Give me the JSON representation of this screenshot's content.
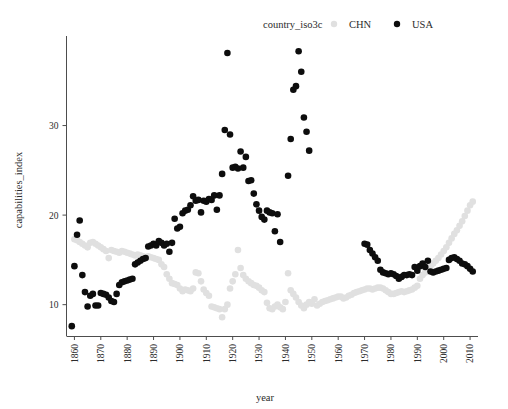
{
  "legend": {
    "title": "country_iso3c",
    "entries": [
      {
        "label": "CHN",
        "color": "#e0e0e0"
      },
      {
        "label": "USA",
        "color": "#0d0d0d"
      }
    ]
  },
  "axes": {
    "x_title": "year",
    "y_title": "capabilities_index",
    "x_ticks": [
      "1860",
      "1870",
      "1880",
      "1890",
      "1900",
      "1910",
      "1920",
      "1930",
      "1940",
      "1950",
      "1960",
      "1970",
      "1980",
      "1990",
      "2000",
      "2010"
    ],
    "y_ticks": [
      "10",
      "20",
      "30"
    ]
  },
  "chart_data": {
    "type": "scatter",
    "title": "",
    "xlabel": "year",
    "ylabel": "capabilities_index",
    "xlim": [
      1857,
      2013
    ],
    "ylim": [
      6.5,
      40
    ],
    "grid": false,
    "legend_position": "top-right",
    "legend_title": "country_iso3c",
    "series": [
      {
        "name": "USA",
        "color": "#0d0d0d",
        "points": [
          [
            1859,
            7.6
          ],
          [
            1860,
            14.3
          ],
          [
            1861,
            17.8
          ],
          [
            1862,
            19.4
          ],
          [
            1863,
            13.3
          ],
          [
            1864,
            11.4
          ],
          [
            1865,
            9.8
          ],
          [
            1866,
            11.0
          ],
          [
            1867,
            11.2
          ],
          [
            1868,
            9.9
          ],
          [
            1869,
            9.9
          ],
          [
            1870,
            11.3
          ],
          [
            1871,
            11.2
          ],
          [
            1872,
            11.1
          ],
          [
            1873,
            10.8
          ],
          [
            1874,
            10.4
          ],
          [
            1875,
            10.3
          ],
          [
            1876,
            11.2
          ],
          [
            1877,
            12.2
          ],
          [
            1878,
            12.5
          ],
          [
            1879,
            12.6
          ],
          [
            1880,
            12.7
          ],
          [
            1881,
            12.8
          ],
          [
            1882,
            12.9
          ],
          [
            1883,
            14.5
          ],
          [
            1884,
            14.7
          ],
          [
            1885,
            14.9
          ],
          [
            1886,
            15.1
          ],
          [
            1887,
            15.2
          ],
          [
            1888,
            16.5
          ],
          [
            1889,
            16.6
          ],
          [
            1890,
            16.8
          ],
          [
            1891,
            16.6
          ],
          [
            1892,
            17.1
          ],
          [
            1893,
            16.9
          ],
          [
            1894,
            16.6
          ],
          [
            1895,
            16.8
          ],
          [
            1896,
            15.9
          ],
          [
            1897,
            16.9
          ],
          [
            1898,
            19.6
          ],
          [
            1899,
            18.5
          ],
          [
            1900,
            18.7
          ],
          [
            1901,
            20.2
          ],
          [
            1902,
            20.5
          ],
          [
            1903,
            20.6
          ],
          [
            1904,
            21.1
          ],
          [
            1905,
            22.1
          ],
          [
            1906,
            21.6
          ],
          [
            1907,
            21.7
          ],
          [
            1908,
            20.3
          ],
          [
            1909,
            21.6
          ],
          [
            1910,
            21.5
          ],
          [
            1911,
            21.8
          ],
          [
            1912,
            21.7
          ],
          [
            1913,
            22.2
          ],
          [
            1914,
            20.6
          ],
          [
            1915,
            22.2
          ],
          [
            1916,
            24.6
          ],
          [
            1917,
            29.5
          ],
          [
            1918,
            38.1
          ],
          [
            1919,
            29.0
          ],
          [
            1920,
            25.3
          ],
          [
            1921,
            25.4
          ],
          [
            1922,
            25.2
          ],
          [
            1923,
            27.1
          ],
          [
            1924,
            25.3
          ],
          [
            1925,
            26.5
          ],
          [
            1926,
            23.8
          ],
          [
            1927,
            23.9
          ],
          [
            1928,
            22.4
          ],
          [
            1929,
            21.2
          ],
          [
            1930,
            20.5
          ],
          [
            1931,
            19.8
          ],
          [
            1932,
            19.5
          ],
          [
            1933,
            20.5
          ],
          [
            1934,
            20.3
          ],
          [
            1935,
            20.2
          ],
          [
            1936,
            18.2
          ],
          [
            1937,
            20.1
          ],
          [
            1938,
            17.0
          ],
          [
            1941,
            24.4
          ],
          [
            1942,
            28.5
          ],
          [
            1943,
            34.0
          ],
          [
            1944,
            34.4
          ],
          [
            1945,
            38.3
          ],
          [
            1946,
            36.0
          ],
          [
            1947,
            30.9
          ],
          [
            1948,
            29.3
          ],
          [
            1949,
            27.2
          ],
          [
            1970,
            16.8
          ],
          [
            1971,
            16.7
          ],
          [
            1972,
            16.1
          ],
          [
            1973,
            15.7
          ],
          [
            1974,
            15.3
          ],
          [
            1975,
            14.9
          ],
          [
            1976,
            13.9
          ],
          [
            1977,
            13.6
          ],
          [
            1978,
            13.5
          ],
          [
            1979,
            13.4
          ],
          [
            1980,
            13.5
          ],
          [
            1981,
            13.4
          ],
          [
            1982,
            13.2
          ],
          [
            1983,
            12.9
          ],
          [
            1984,
            13.1
          ],
          [
            1985,
            13.3
          ],
          [
            1986,
            13.3
          ],
          [
            1987,
            13.4
          ],
          [
            1988,
            13.3
          ],
          [
            1989,
            14.2
          ],
          [
            1990,
            13.8
          ],
          [
            1991,
            14.3
          ],
          [
            1992,
            14.6
          ],
          [
            1993,
            14.2
          ],
          [
            1994,
            14.9
          ],
          [
            1995,
            13.7
          ],
          [
            1996,
            13.6
          ],
          [
            1997,
            13.7
          ],
          [
            1998,
            13.8
          ],
          [
            1999,
            13.9
          ],
          [
            2000,
            14.0
          ],
          [
            2001,
            14.1
          ],
          [
            2002,
            15.0
          ],
          [
            2003,
            15.2
          ],
          [
            2004,
            15.3
          ],
          [
            2005,
            15.1
          ],
          [
            2006,
            14.9
          ],
          [
            2007,
            14.6
          ],
          [
            2008,
            14.5
          ],
          [
            2009,
            14.3
          ],
          [
            2010,
            14.0
          ],
          [
            2011,
            13.7
          ]
        ]
      },
      {
        "name": "CHN",
        "color": "#e0e0e0",
        "points": [
          [
            1860,
            17.3
          ],
          [
            1861,
            17.2
          ],
          [
            1862,
            17.0
          ],
          [
            1863,
            16.8
          ],
          [
            1864,
            16.6
          ],
          [
            1865,
            16.4
          ],
          [
            1866,
            16.9
          ],
          [
            1867,
            17.0
          ],
          [
            1868,
            16.8
          ],
          [
            1869,
            16.6
          ],
          [
            1870,
            16.4
          ],
          [
            1871,
            16.2
          ],
          [
            1872,
            16.0
          ],
          [
            1873,
            15.2
          ],
          [
            1874,
            16.1
          ],
          [
            1875,
            16.0
          ],
          [
            1876,
            15.9
          ],
          [
            1877,
            15.8
          ],
          [
            1878,
            16.0
          ],
          [
            1879,
            15.9
          ],
          [
            1880,
            15.8
          ],
          [
            1881,
            15.7
          ],
          [
            1882,
            15.6
          ],
          [
            1883,
            15.5
          ],
          [
            1884,
            15.6
          ],
          [
            1885,
            15.5
          ],
          [
            1886,
            15.4
          ],
          [
            1887,
            15.3
          ],
          [
            1888,
            15.4
          ],
          [
            1889,
            15.3
          ],
          [
            1890,
            15.2
          ],
          [
            1891,
            15.1
          ],
          [
            1892,
            15.0
          ],
          [
            1893,
            14.5
          ],
          [
            1894,
            14.2
          ],
          [
            1895,
            13.4
          ],
          [
            1896,
            12.9
          ],
          [
            1897,
            12.4
          ],
          [
            1898,
            12.3
          ],
          [
            1899,
            12.2
          ],
          [
            1900,
            11.8
          ],
          [
            1901,
            11.5
          ],
          [
            1902,
            11.7
          ],
          [
            1903,
            11.6
          ],
          [
            1904,
            11.5
          ],
          [
            1905,
            11.8
          ],
          [
            1906,
            13.6
          ],
          [
            1907,
            13.5
          ],
          [
            1908,
            12.6
          ],
          [
            1909,
            11.7
          ],
          [
            1910,
            11.3
          ],
          [
            1911,
            11.0
          ],
          [
            1912,
            9.8
          ],
          [
            1913,
            9.7
          ],
          [
            1914,
            9.6
          ],
          [
            1915,
            9.5
          ],
          [
            1916,
            8.6
          ],
          [
            1917,
            9.5
          ],
          [
            1918,
            10.0
          ],
          [
            1919,
            11.8
          ],
          [
            1920,
            12.6
          ],
          [
            1921,
            13.4
          ],
          [
            1922,
            16.1
          ],
          [
            1923,
            14.1
          ],
          [
            1924,
            13.3
          ],
          [
            1925,
            12.9
          ],
          [
            1926,
            12.6
          ],
          [
            1927,
            12.4
          ],
          [
            1928,
            12.2
          ],
          [
            1929,
            12.1
          ],
          [
            1930,
            11.9
          ],
          [
            1931,
            11.6
          ],
          [
            1932,
            11.4
          ],
          [
            1933,
            10.2
          ],
          [
            1934,
            9.6
          ],
          [
            1935,
            9.5
          ],
          [
            1936,
            9.8
          ],
          [
            1937,
            10.0
          ],
          [
            1938,
            9.7
          ],
          [
            1939,
            9.5
          ],
          [
            1940,
            10.3
          ],
          [
            1941,
            13.5
          ],
          [
            1942,
            11.6
          ],
          [
            1943,
            11.2
          ],
          [
            1944,
            10.8
          ],
          [
            1945,
            10.3
          ],
          [
            1946,
            9.9
          ],
          [
            1947,
            9.6
          ],
          [
            1948,
            10.0
          ],
          [
            1949,
            10.3
          ],
          [
            1950,
            10.1
          ],
          [
            1951,
            10.6
          ],
          [
            1952,
            9.9
          ],
          [
            1953,
            10.1
          ],
          [
            1954,
            10.3
          ],
          [
            1955,
            10.4
          ],
          [
            1956,
            10.5
          ],
          [
            1957,
            10.6
          ],
          [
            1958,
            10.7
          ],
          [
            1959,
            10.8
          ],
          [
            1960,
            10.9
          ],
          [
            1961,
            10.9
          ],
          [
            1962,
            10.7
          ],
          [
            1963,
            10.8
          ],
          [
            1964,
            11.0
          ],
          [
            1965,
            11.1
          ],
          [
            1966,
            11.3
          ],
          [
            1967,
            11.4
          ],
          [
            1968,
            11.5
          ],
          [
            1969,
            11.6
          ],
          [
            1970,
            11.7
          ],
          [
            1971,
            11.8
          ],
          [
            1972,
            11.8
          ],
          [
            1973,
            11.7
          ],
          [
            1974,
            11.8
          ],
          [
            1975,
            11.9
          ],
          [
            1976,
            11.9
          ],
          [
            1977,
            11.8
          ],
          [
            1978,
            11.6
          ],
          [
            1979,
            11.4
          ],
          [
            1980,
            11.2
          ],
          [
            1981,
            11.2
          ],
          [
            1982,
            11.3
          ],
          [
            1983,
            11.4
          ],
          [
            1984,
            11.5
          ],
          [
            1985,
            11.4
          ],
          [
            1986,
            11.5
          ],
          [
            1987,
            11.6
          ],
          [
            1988,
            11.7
          ],
          [
            1989,
            11.9
          ],
          [
            1990,
            12.1
          ],
          [
            1991,
            12.9
          ],
          [
            1992,
            13.3
          ],
          [
            1993,
            13.6
          ],
          [
            1994,
            13.9
          ],
          [
            1995,
            14.3
          ],
          [
            1996,
            14.6
          ],
          [
            1997,
            14.9
          ],
          [
            1998,
            15.2
          ],
          [
            1999,
            15.6
          ],
          [
            2000,
            16.0
          ],
          [
            2001,
            16.4
          ],
          [
            2002,
            16.9
          ],
          [
            2003,
            17.4
          ],
          [
            2004,
            17.9
          ],
          [
            2005,
            18.3
          ],
          [
            2006,
            18.8
          ],
          [
            2007,
            19.3
          ],
          [
            2008,
            19.9
          ],
          [
            2009,
            20.5
          ],
          [
            2010,
            21.1
          ],
          [
            2011,
            21.5
          ]
        ]
      }
    ]
  }
}
